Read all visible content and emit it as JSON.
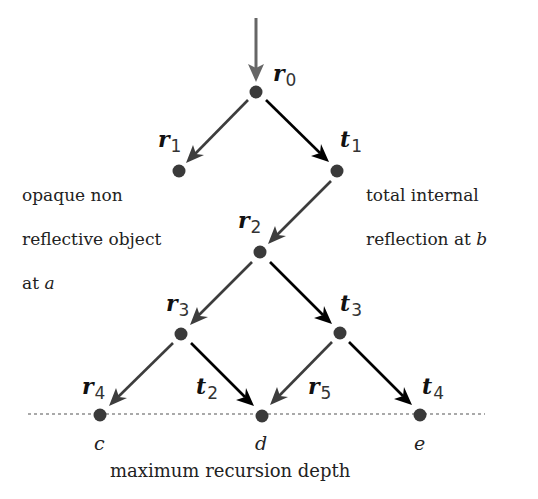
{
  "diagram": {
    "colors": {
      "reflected": "#3d3d3d",
      "transmitted": "#000000",
      "node": "#3a3a3a",
      "depth_line": "#555555"
    },
    "nodes": [
      {
        "id": "r0",
        "x": 256,
        "y": 92
      },
      {
        "id": "r1",
        "x": 179,
        "y": 171
      },
      {
        "id": "t1",
        "x": 337,
        "y": 171
      },
      {
        "id": "r2",
        "x": 260,
        "y": 252
      },
      {
        "id": "r3",
        "x": 181,
        "y": 334
      },
      {
        "id": "t3",
        "x": 340,
        "y": 333
      },
      {
        "id": "c",
        "x": 100,
        "y": 415
      },
      {
        "id": "d",
        "x": 262,
        "y": 416
      },
      {
        "id": "e",
        "x": 420,
        "y": 415
      }
    ],
    "edges": [
      {
        "from": "incoming",
        "to": "r0",
        "type": "incoming"
      },
      {
        "from": "r0",
        "to": "r1",
        "label": "r1",
        "type": "reflected"
      },
      {
        "from": "r0",
        "to": "t1",
        "label": "t1",
        "type": "transmitted"
      },
      {
        "from": "t1",
        "to": "r2",
        "label": "r2",
        "type": "reflected"
      },
      {
        "from": "r2",
        "to": "r3",
        "label": "r3",
        "type": "reflected"
      },
      {
        "from": "r2",
        "to": "t3",
        "label": "t3",
        "type": "transmitted"
      },
      {
        "from": "r3",
        "to": "c",
        "label": "r4",
        "type": "reflected"
      },
      {
        "from": "r3",
        "to": "d",
        "label": "t2",
        "type": "transmitted"
      },
      {
        "from": "t3",
        "to": "d",
        "label": "r5",
        "type": "reflected"
      },
      {
        "from": "t3",
        "to": "e",
        "label": "t4",
        "type": "transmitted"
      }
    ],
    "ray_labels": {
      "r0": {
        "base": "r",
        "sub": "0"
      },
      "r1": {
        "base": "r",
        "sub": "1"
      },
      "t1": {
        "base": "t",
        "sub": "1"
      },
      "r2": {
        "base": "r",
        "sub": "2"
      },
      "r3": {
        "base": "r",
        "sub": "3"
      },
      "t3": {
        "base": "t",
        "sub": "3"
      },
      "r4": {
        "base": "r",
        "sub": "4"
      },
      "t2": {
        "base": "t",
        "sub": "2"
      },
      "r5": {
        "base": "r",
        "sub": "5"
      },
      "t4": {
        "base": "t",
        "sub": "4"
      }
    },
    "annotations": {
      "opaque_line1": "opaque non",
      "opaque_line2": "reflective object",
      "opaque_line3_prefix": "at ",
      "opaque_point": "a",
      "tir_line1": "total internal",
      "tir_line2_prefix": "reflection at ",
      "tir_point": "b"
    },
    "points": {
      "c": "c",
      "d": "d",
      "e": "e"
    },
    "depth_label": "maximum recursion depth"
  }
}
